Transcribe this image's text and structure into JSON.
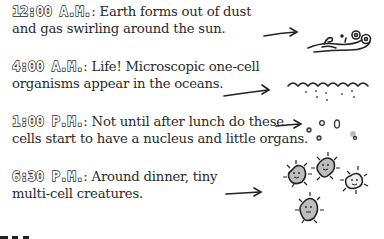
{
  "entries": [
    {
      "time": "12:00 A.M.",
      "sep": ": ",
      "line1": "Earth forms out of dust",
      "line2": "and gas swirling around the sun.",
      "illustration": "dust-swirl-icon"
    },
    {
      "time": "4:00 A.M.",
      "sep": ": ",
      "line1": "Life! Microscopic one-cell",
      "line2": "organisms appear in the oceans.",
      "illustration": "ocean-wave-icon"
    },
    {
      "time": "1:00 P.M.",
      "sep": ": ",
      "line1": "Not until after lunch do these",
      "line2": "cells start to have a nucleus and little organs.",
      "illustration": "cells-icon"
    },
    {
      "time": "6:30 P.M.",
      "sep": ": ",
      "line1": "Around dinner, tiny",
      "line2": "multi-cell creatures.",
      "illustration": "creatures-icon"
    }
  ],
  "colors": {
    "ink": "#222222",
    "text": "#2a2a2a",
    "cell_fill": "#bdbdbd"
  }
}
